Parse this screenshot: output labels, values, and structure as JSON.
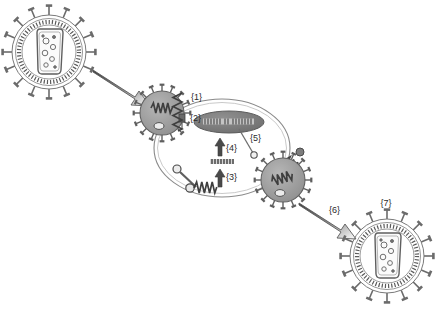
{
  "figure": {
    "background_color": "#ffffff",
    "width": 442,
    "height": 314,
    "ink_color": "#6b6b6b",
    "dark_ink_color": "#4a4a4a",
    "label_color": "#2b2b2b",
    "virus_fill": "#9a9a9a",
    "nucleus_fill": "#7d7d7d",
    "dna_fill": "#b9b9b9",
    "arrow_dark": "#4f4f4f",
    "arrow_light": "#e8e8e8"
  },
  "labels": [
    {
      "id": "1",
      "text": "{1}",
      "x": 191,
      "y": 100,
      "step": "attachment-binding"
    },
    {
      "id": "2",
      "text": "{2}",
      "x": 190,
      "y": 121,
      "step": "entry-fusion"
    },
    {
      "id": "3",
      "text": "{3}",
      "x": 226,
      "y": 180,
      "step": "translation"
    },
    {
      "id": "4",
      "text": "{4}",
      "x": 226,
      "y": 151,
      "step": "replication"
    },
    {
      "id": "5",
      "text": "{5}",
      "x": 250,
      "y": 141,
      "step": "nuclear-import"
    },
    {
      "id": "6",
      "text": "{6}",
      "x": 329,
      "y": 213,
      "step": "release"
    },
    {
      "id": "7",
      "text": "{7}",
      "x": 386,
      "y": 206,
      "step": "mature-virion"
    }
  ],
  "structures": {
    "free_virion_left": {
      "name": "free-virion-left",
      "cx": 49,
      "cy": 52,
      "r": 37,
      "spike_count": 16
    },
    "attached_virion": {
      "name": "attached-virion",
      "cx": 162,
      "cy": 113,
      "r": 22,
      "spike_count": 16
    },
    "budding_virion": {
      "name": "budding-virion",
      "cx": 283,
      "cy": 180,
      "r": 22,
      "spike_count": 16
    },
    "progeny_virion_right": {
      "name": "progeny-virion-right",
      "cx": 387,
      "cy": 256,
      "r": 37,
      "spike_count": 16
    },
    "host_cell": {
      "name": "host-cell",
      "cx": 222,
      "cy": 148,
      "rx": 68,
      "ry": 49
    },
    "nucleus": {
      "name": "cell-nucleus",
      "cx": 229,
      "cy": 122,
      "rx": 35,
      "ry": 11
    },
    "genome_segment": {
      "name": "viral-genome-segment",
      "cx": 222,
      "cy": 162,
      "width": 24
    }
  },
  "arrows": {
    "entry_arrow": {
      "name": "entry-arrow",
      "from_x": 94,
      "from_y": 72,
      "to_x": 143,
      "to_y": 104
    },
    "release_arrow": {
      "name": "release-arrow",
      "from_x": 300,
      "from_y": 205,
      "to_x": 348,
      "to_y": 237
    },
    "replication_arrow": {
      "name": "replication-arrow-4",
      "x": 220,
      "y_from": 158,
      "y_to": 140
    },
    "translation_arrow": {
      "name": "translation-arrow-3",
      "x": 220,
      "y_from": 188,
      "y_to": 169
    }
  }
}
